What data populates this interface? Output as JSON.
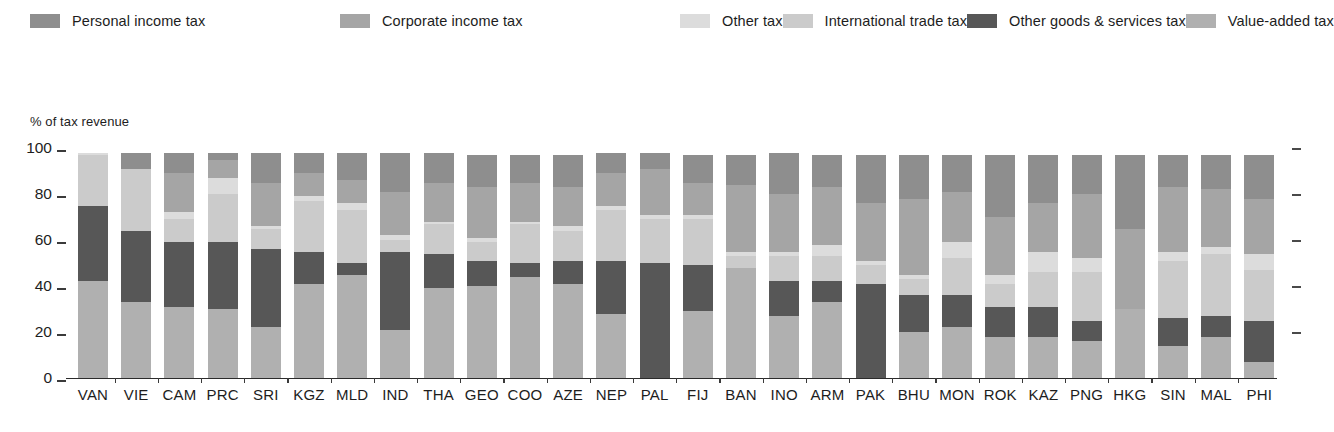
{
  "axis_title": "% of tax revenue",
  "legend": {
    "items": [
      {
        "label": "Personal income tax",
        "key": "personal",
        "color": "#8e8e8e"
      },
      {
        "label": "Corporate income tax",
        "key": "corporate",
        "color": "#a5a5a5"
      },
      {
        "label": "Other tax",
        "key": "other",
        "color": "#dcdcdc"
      },
      {
        "label": "International trade tax",
        "key": "trade",
        "color": "#cbcbcb"
      },
      {
        "label": "Other goods & services tax",
        "key": "goods",
        "color": "#575757"
      },
      {
        "label": "Value-added tax",
        "key": "vat",
        "color": "#b0b0b0"
      }
    ]
  },
  "chart_data": {
    "type": "bar",
    "subtype": "stacked-vertical",
    "title": "",
    "subtitle": "",
    "xlabel": "",
    "ylabel": "% of tax revenue",
    "ylim": [
      0,
      100
    ],
    "yticks": [
      0,
      20,
      40,
      60,
      80,
      100
    ],
    "ytick_labels": [
      "0",
      "20",
      "40",
      "60",
      "80",
      "100"
    ],
    "grid": false,
    "legend_position": "top-left",
    "stack_order_bottom_to_top": [
      "vat",
      "goods",
      "trade",
      "other",
      "corporate",
      "personal"
    ],
    "series": [
      {
        "name": "Value-added tax",
        "key": "vat",
        "color": "#b0b0b0",
        "values": [
          42,
          33,
          31,
          30,
          22,
          41,
          45,
          21,
          39,
          40,
          44,
          41,
          28,
          0,
          29,
          48,
          27,
          33,
          0,
          20,
          22,
          18,
          18,
          16,
          30,
          14,
          18,
          7
        ]
      },
      {
        "name": "Other goods & services tax",
        "key": "goods",
        "color": "#575757",
        "values": [
          33,
          31,
          28,
          29,
          34,
          14,
          5,
          34,
          15,
          11,
          6,
          10,
          23,
          50,
          20,
          0,
          15,
          9,
          41,
          16,
          14,
          13,
          13,
          9,
          0,
          12,
          9,
          18
        ]
      },
      {
        "name": "International trade tax",
        "key": "trade",
        "color": "#cbcbcb",
        "values": [
          22,
          27,
          10,
          21,
          9,
          22,
          23,
          5,
          13,
          8,
          17,
          13,
          22,
          19,
          20,
          5,
          11,
          11,
          8,
          7,
          16,
          10,
          15,
          21,
          0,
          25,
          27,
          22
        ]
      },
      {
        "name": "Other tax",
        "key": "other",
        "color": "#dcdcdc",
        "values": [
          1,
          0,
          3,
          7,
          1,
          2,
          3,
          2,
          1,
          2,
          1,
          2,
          2,
          2,
          2,
          2,
          2,
          5,
          2,
          2,
          7,
          4,
          9,
          6,
          0,
          4,
          3,
          7
        ]
      },
      {
        "name": "Corporate income tax",
        "key": "corporate",
        "color": "#a5a5a5",
        "values": [
          0,
          0,
          17,
          8,
          19,
          10,
          10,
          19,
          17,
          22,
          17,
          17,
          14,
          20,
          14,
          29,
          25,
          25,
          25,
          33,
          22,
          25,
          21,
          28,
          35,
          28,
          25,
          24
        ]
      },
      {
        "name": "Personal income tax",
        "key": "personal",
        "color": "#8e8e8e",
        "values": [
          0,
          7,
          9,
          3,
          13,
          9,
          12,
          17,
          13,
          14,
          12,
          14,
          9,
          7,
          12,
          13,
          18,
          14,
          21,
          19,
          16,
          27,
          21,
          17,
          32,
          14,
          15,
          19
        ]
      }
    ],
    "categories": [
      "VAN",
      "VIE",
      "CAM",
      "PRC",
      "SRI",
      "KGZ",
      "MLD",
      "IND",
      "THA",
      "GEO",
      "COO",
      "AZE",
      "NEP",
      "PAL",
      "FIJ",
      "BAN",
      "INO",
      "ARM",
      "PAK",
      "BHU",
      "MON",
      "ROK",
      "KAZ",
      "PNG",
      "HKG",
      "SIN",
      "MAL",
      "PHI"
    ]
  }
}
